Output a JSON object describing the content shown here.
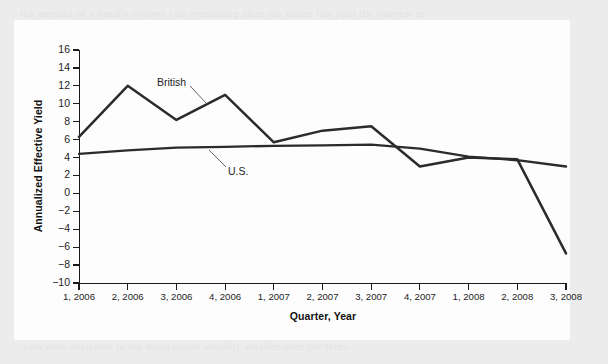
{
  "figure": {
    "background_color": "#ececed",
    "panel_color": "#fdfdfd",
    "line_color": "#2b2b2b",
    "axis_color": "#1a1a1a"
  },
  "ghost_text": {
    "top_line_1": "the amount of a bond's coupon rate remaining after the issuer has paid the interest to",
    "top_line_2": "investors does not depend on the relative size of the variable rate guaranteed by the",
    "bottom_line_1": "interest rate on the bonds and the yields on the notes declines, making the net",
    "bottom_line_2": "proceeds available to the bond issuer steadily smaller over the term."
  },
  "chart_data": {
    "type": "line",
    "title": "",
    "xlabel": "Quarter, Year",
    "ylabel": "Annualized Effective Yield",
    "ylim": [
      -10,
      16
    ],
    "ytick_step": 2,
    "grid": false,
    "legend_position": "inline-annotation",
    "categories": [
      "1, 2006",
      "2, 2006",
      "3, 2006",
      "4, 2006",
      "1, 2007",
      "2, 2007",
      "3, 2007",
      "4, 2007",
      "1, 2008",
      "2, 2008",
      "3, 2008"
    ],
    "yticks": [
      16,
      14,
      12,
      10,
      8,
      6,
      4,
      2,
      0,
      -2,
      -4,
      -6,
      -8,
      -10
    ],
    "ytick_labels": [
      "16",
      "14",
      "12",
      "10",
      "8",
      "6",
      "4",
      "2",
      "0",
      "−2",
      "−4",
      "−6",
      "−8",
      "−10"
    ],
    "series": [
      {
        "name": "British",
        "label": "British",
        "values": [
          6.3,
          12.0,
          8.2,
          11.0,
          5.7,
          7.0,
          7.5,
          3.0,
          4.0,
          3.8,
          -6.7
        ]
      },
      {
        "name": "U.S.",
        "label": "U.S.",
        "values": [
          4.4,
          4.8,
          5.1,
          5.2,
          5.3,
          5.35,
          5.45,
          5.0,
          4.1,
          3.7,
          3.0
        ]
      }
    ],
    "annotations": [
      {
        "text": "British",
        "series": "British",
        "x_index": 3
      },
      {
        "text": "U.S.",
        "series": "U.S.",
        "x_index": 4
      }
    ]
  }
}
